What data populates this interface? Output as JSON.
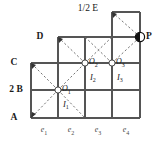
{
  "figure": {
    "type": "geometry-grid-diagram",
    "width": 161,
    "height": 143,
    "background": "#ffffff",
    "stroke_color": "#555555",
    "dash_color": "#666666",
    "text_color": "#1a1a1a"
  },
  "top_label": {
    "text": "1/2 E",
    "x": 88,
    "y": 9
  },
  "point_p": {
    "label": "P",
    "x": 140,
    "y": 37,
    "marker": "half-filled-circle",
    "fill_left": "#111111",
    "fill_right": "#ffffff",
    "label_x": 149,
    "label_y": 37
  },
  "left_labels": [
    {
      "text": "D",
      "x": 40,
      "y": 37
    },
    {
      "text": "C",
      "x": 14,
      "y": 63
    },
    {
      "text": "2 B",
      "x": 14,
      "y": 90
    },
    {
      "text": "A",
      "x": 14,
      "y": 118
    }
  ],
  "bottom_labels": [
    {
      "text": "e",
      "sub": "1",
      "x": 44,
      "y": 131
    },
    {
      "text": "e",
      "sub": "2",
      "x": 71,
      "y": 131
    },
    {
      "text": "e",
      "sub": "3",
      "x": 98,
      "y": 131
    },
    {
      "text": "e",
      "sub": "4",
      "x": 126,
      "y": 131
    }
  ],
  "nodes": [
    {
      "id": "O1",
      "text": "O",
      "sub": "1",
      "x": 58,
      "y": 90,
      "label_x": 61,
      "label_y": 90
    },
    {
      "id": "O2",
      "text": "O",
      "sub": "2",
      "x": 85,
      "y": 63,
      "label_x": 88,
      "label_y": 63
    },
    {
      "id": "O3",
      "text": "O",
      "sub": "3",
      "x": 112,
      "y": 63,
      "label_x": 115,
      "label_y": 63
    }
  ],
  "edge_labels": [
    {
      "text": "I",
      "sub": "1",
      "x": 64,
      "y": 105
    },
    {
      "text": "I",
      "sub": "2",
      "x": 91,
      "y": 78
    },
    {
      "text": "I",
      "sub": "3",
      "x": 118,
      "y": 78
    }
  ],
  "grid": {
    "x_lines": [
      31,
      58,
      85,
      112,
      140
    ],
    "y_lines": [
      12,
      37,
      63,
      90,
      118
    ],
    "columns": 4,
    "rows": 4
  },
  "geometry_notes": {
    "lower_region": "x 31..140, y 63..118",
    "mid_region": "x 58..140, y 37..63",
    "top_region": "x 112..140, y 12..37"
  }
}
